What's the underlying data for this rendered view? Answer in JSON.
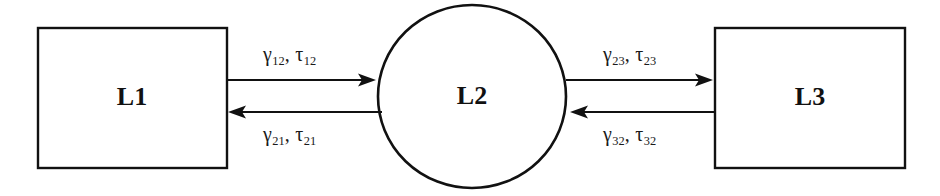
{
  "diagram": {
    "background_color": "#ffffff",
    "stroke_color": "#111111",
    "nodes": [
      {
        "id": "L1",
        "label": "L1",
        "shape": "rectangle"
      },
      {
        "id": "L2",
        "label": "L2",
        "shape": "circle"
      },
      {
        "id": "L3",
        "label": "L3",
        "shape": "rectangle"
      }
    ],
    "edges": [
      {
        "id": "L1-to-L2",
        "from": "L1",
        "to": "L2",
        "direction": "right",
        "gamma": "γ",
        "gamma_sub": "12",
        "tau": "τ",
        "tau_sub": "12",
        "separator": ","
      },
      {
        "id": "L2-to-L1",
        "from": "L2",
        "to": "L1",
        "direction": "left",
        "gamma": "γ",
        "gamma_sub": "21",
        "tau": "τ",
        "tau_sub": "21",
        "separator": ","
      },
      {
        "id": "L2-to-L3",
        "from": "L2",
        "to": "L3",
        "direction": "right",
        "gamma": "γ",
        "gamma_sub": "23",
        "tau": "τ",
        "tau_sub": "23",
        "separator": ","
      },
      {
        "id": "L3-to-L2",
        "from": "L3",
        "to": "L2",
        "direction": "left",
        "gamma": "γ",
        "gamma_sub": "32",
        "tau": "τ",
        "tau_sub": "32",
        "separator": ","
      }
    ]
  }
}
